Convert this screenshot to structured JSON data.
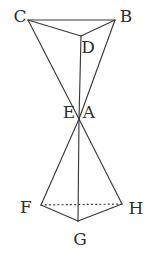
{
  "figure": {
    "canvas": {
      "width": 156,
      "height": 260
    },
    "background_color": "#ffffff",
    "line_color": "#3a3a3c",
    "label_color": "#2e2e30",
    "vertices": [
      {
        "id": "C",
        "label": "C",
        "x": 28,
        "y": 20,
        "label_x": 20,
        "label_y": 16
      },
      {
        "id": "B",
        "label": "B",
        "x": 115,
        "y": 20,
        "label_x": 126,
        "label_y": 16
      },
      {
        "id": "D",
        "label": "D",
        "x": 81,
        "y": 36,
        "label_x": 88,
        "label_y": 47
      },
      {
        "id": "E",
        "label": "E",
        "x": 79,
        "y": 119,
        "label_x": 69,
        "label_y": 112
      },
      {
        "id": "A",
        "label": "A",
        "x": 79,
        "y": 119,
        "label_x": 89,
        "label_y": 112
      },
      {
        "id": "F",
        "label": "F",
        "x": 41,
        "y": 205,
        "label_x": 26,
        "label_y": 207
      },
      {
        "id": "G",
        "label": "G",
        "x": 78,
        "y": 221,
        "label_x": 80,
        "label_y": 239
      },
      {
        "id": "H",
        "label": "H",
        "x": 122,
        "y": 204,
        "label_x": 136,
        "label_y": 208
      }
    ],
    "edges": [
      {
        "from": "C",
        "to": "B",
        "style": "solid",
        "name": "edge-c-b"
      },
      {
        "from": "C",
        "to": "D",
        "style": "solid",
        "name": "edge-c-d"
      },
      {
        "from": "B",
        "to": "D",
        "style": "solid",
        "name": "edge-b-d"
      },
      {
        "from": "C",
        "to": "E",
        "style": "solid",
        "name": "edge-c-apex"
      },
      {
        "from": "B",
        "to": "E",
        "style": "solid",
        "name": "edge-b-apex"
      },
      {
        "from": "D",
        "to": "E",
        "style": "solid",
        "name": "edge-d-apex"
      },
      {
        "from": "A",
        "to": "F",
        "style": "solid",
        "name": "edge-apex-f"
      },
      {
        "from": "A",
        "to": "G",
        "style": "solid",
        "name": "edge-apex-g"
      },
      {
        "from": "A",
        "to": "H",
        "style": "solid",
        "name": "edge-apex-h"
      },
      {
        "from": "F",
        "to": "G",
        "style": "solid",
        "name": "edge-f-g"
      },
      {
        "from": "G",
        "to": "H",
        "style": "solid",
        "name": "edge-g-h"
      },
      {
        "from": "F",
        "to": "H",
        "style": "hidden",
        "name": "edge-f-h-hidden"
      }
    ]
  }
}
